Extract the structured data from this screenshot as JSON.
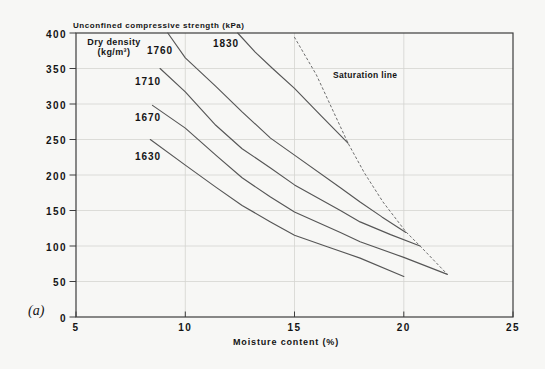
{
  "figure": {
    "panel_label": "(a)",
    "legend_line1": "Dry density",
    "legend_line2": "(kg/m³)"
  },
  "chart_data": {
    "type": "line",
    "title": "Unconfined compressive strength (kPa)",
    "xlabel": "Moisture content (%)",
    "ylabel": "Unconfined compressive strength (kPa)",
    "xlim": [
      5,
      25
    ],
    "ylim": [
      0,
      400
    ],
    "x_ticks": [
      5,
      10,
      15,
      20,
      25
    ],
    "y_ticks": [
      0,
      50,
      100,
      150,
      200,
      250,
      300,
      350,
      400
    ],
    "grid": true,
    "legend_position": "top-left-inside",
    "legend_title": "Dry density (kg/m³)",
    "series": [
      {
        "name": "1630",
        "dry_density_kg_m3": 1630,
        "style": "solid",
        "points": [
          [
            8.4,
            250
          ],
          [
            10,
            214
          ],
          [
            11.4,
            183
          ],
          [
            12.6,
            157
          ],
          [
            13.9,
            134
          ],
          [
            15,
            115
          ],
          [
            16.5,
            99
          ],
          [
            18,
            83
          ],
          [
            20,
            57
          ]
        ]
      },
      {
        "name": "1670",
        "dry_density_kg_m3": 1670,
        "style": "solid",
        "points": [
          [
            8.5,
            298
          ],
          [
            10,
            266
          ],
          [
            11.4,
            228
          ],
          [
            12.6,
            196
          ],
          [
            13.9,
            169
          ],
          [
            15,
            148
          ],
          [
            17.1,
            119
          ],
          [
            18,
            106
          ],
          [
            20,
            84
          ],
          [
            22,
            60
          ]
        ]
      },
      {
        "name": "1710",
        "dry_density_kg_m3": 1710,
        "style": "solid",
        "points": [
          [
            8.85,
            350
          ],
          [
            10,
            317
          ],
          [
            11.4,
            270
          ],
          [
            12.6,
            237
          ],
          [
            13.9,
            210
          ],
          [
            15,
            186
          ],
          [
            17.1,
            150
          ],
          [
            18,
            134
          ],
          [
            19.4,
            116
          ],
          [
            20.75,
            100
          ]
        ]
      },
      {
        "name": "1760",
        "dry_density_kg_m3": 1760,
        "style": "solid",
        "points": [
          [
            9.2,
            400
          ],
          [
            10,
            365
          ],
          [
            11.4,
            325
          ],
          [
            12.6,
            289
          ],
          [
            13.9,
            252
          ],
          [
            15,
            228
          ],
          [
            17.1,
            182
          ],
          [
            18,
            162
          ],
          [
            19,
            141
          ],
          [
            20.1,
            119
          ]
        ]
      },
      {
        "name": "1830",
        "dry_density_kg_m3": 1830,
        "style": "solid",
        "points": [
          [
            12.4,
            400
          ],
          [
            13.2,
            373
          ],
          [
            14,
            350
          ],
          [
            15,
            322
          ],
          [
            16.2,
            284
          ],
          [
            17.45,
            245
          ]
        ]
      },
      {
        "name": "Saturation line",
        "style": "dashed",
        "points": [
          [
            15.0,
            394
          ],
          [
            16.0,
            341
          ],
          [
            17.45,
            245
          ],
          [
            18.2,
            203
          ],
          [
            19.05,
            162
          ],
          [
            20.1,
            120
          ],
          [
            20.75,
            100
          ],
          [
            22.0,
            60
          ]
        ]
      }
    ]
  }
}
